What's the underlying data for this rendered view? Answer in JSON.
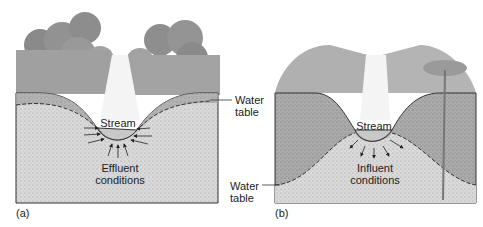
{
  "panels": [
    {
      "id": "a",
      "label": "(a)",
      "stream_label": "Stream",
      "condition_line1": "Effluent",
      "condition_line2": "conditions",
      "water_table_line1": "Water",
      "water_table_line2": "table"
    },
    {
      "id": "b",
      "label": "(b)",
      "stream_label": "Stream",
      "condition_line1": "Influent",
      "condition_line2": "conditions",
      "water_table_line1": "Water",
      "water_table_line2": "table"
    }
  ],
  "colors": {
    "soil_light": "#d9d9d9",
    "soil_dark": "#a8a8a8",
    "vegetation": "#8f8f8f",
    "stream": "#f2f2f2",
    "line": "#333333"
  }
}
